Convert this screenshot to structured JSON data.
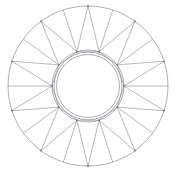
{
  "canvas": {
    "width": 176,
    "height": 190,
    "background_color": "#ffffff"
  },
  "figure": {
    "name": "rosette-wheel-diagram",
    "kind": "geometric-line-drawing",
    "line_color": "#8a8a92",
    "line_width": 0.6,
    "fill": "none"
  },
  "geometry": {
    "center": {
      "cx": 88,
      "cy": 86
    },
    "outer_circle": {
      "r": 80
    },
    "inner_circles": [
      {
        "r": 36
      },
      {
        "r": 34
      },
      {
        "r": 31.5
      }
    ],
    "point_count": 10,
    "outer_vertex_angle_offset_deg": -90,
    "inner_vertex_angle_offset_deg": -72,
    "outer_vertex_radius": 80,
    "inner_vertex_radius": 36
  },
  "chart_data": {
    "type": "scatter",
    "title": "",
    "xlabel": "",
    "ylabel": "",
    "grid": false,
    "legend": "none",
    "xlim": [
      0,
      176
    ],
    "ylim": [
      0,
      190
    ]
  }
}
